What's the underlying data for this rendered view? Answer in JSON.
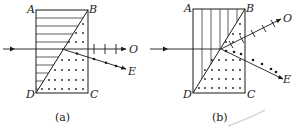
{
  "figures": [
    {
      "id": "a",
      "caption": "(a)",
      "corners": {
        "A": "A",
        "B": "B",
        "C": "C",
        "D": "D"
      },
      "rays": {
        "ordinary": "O",
        "extraordinary": "E"
      },
      "left_prism_hatching": "horizontal",
      "right_prism_marking": "dots"
    },
    {
      "id": "b",
      "caption": "(b)",
      "corners": {
        "A": "A",
        "B": "B",
        "C": "C",
        "D": "D"
      },
      "rays": {
        "ordinary": "O",
        "extraordinary": "E"
      },
      "left_prism_hatching": "vertical",
      "right_prism_marking": "dots"
    }
  ],
  "colors": {
    "ink": "#1a1a1a",
    "background": "#ffffff"
  }
}
